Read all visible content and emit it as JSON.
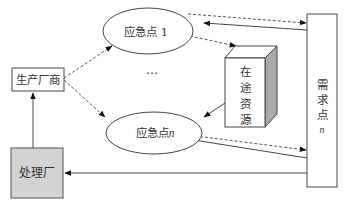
{
  "diagram": {
    "nodes": {
      "manufacturer": {
        "label": "生产厂商"
      },
      "treatment_plant": {
        "label": "处理厂",
        "fill": "#d3d3d3"
      },
      "emergency_point_1": {
        "label": "应急点 1",
        "label_main": "应急点",
        "label_index": "1"
      },
      "emergency_point_n": {
        "label": "应急点n",
        "label_main": "应急点",
        "label_index": "n"
      },
      "ellipsis": {
        "label": "…"
      },
      "in_transit_resources": {
        "label": "在途资源",
        "chars": [
          "在",
          "途",
          "资",
          "源"
        ],
        "side_fill": "#a9a9a9"
      },
      "demand_point": {
        "label": "需求点 n",
        "chars": [
          "需",
          "求",
          "点"
        ],
        "index": "n"
      }
    },
    "edges": [
      {
        "from": "处理厂",
        "to": "生产厂商",
        "style": "solid"
      },
      {
        "from": "生产厂商",
        "to": "应急点 1",
        "style": "dashed"
      },
      {
        "from": "生产厂商",
        "to": "应急点n",
        "style": "dashed"
      },
      {
        "from": "应急点 1",
        "to": "需求点 n",
        "style": "dashed"
      },
      {
        "from": "需求点 n",
        "to": "应急点 1",
        "style": "solid"
      },
      {
        "from": "应急点 1",
        "to": "在途资源",
        "style": "dashed"
      },
      {
        "from": "在途资源",
        "to": "应急点n",
        "style": "solid"
      },
      {
        "from": "应急点n",
        "to": "需求点 n",
        "style": "dashed"
      },
      {
        "from": "需求点 n",
        "to": "应急点n",
        "style": "solid"
      },
      {
        "from": "需求点 n",
        "to": "处理厂",
        "style": "solid"
      }
    ],
    "colors": {
      "stroke": "#333333",
      "gray_box": "#d3d3d3",
      "side_face": "#a9a9a9"
    }
  }
}
